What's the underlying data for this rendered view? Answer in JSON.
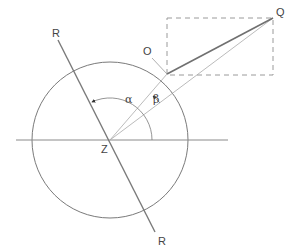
{
  "diagram": {
    "labels": {
      "r_top": "R",
      "r_bottom": "R",
      "q": "Q",
      "o": "O",
      "z": "Z",
      "alpha": "α",
      "beta": "β"
    },
    "colors": {
      "line": "#8a8a8a",
      "dark_line": "#707070",
      "dashed": "#9a9a9a",
      "text": "#444444"
    }
  }
}
